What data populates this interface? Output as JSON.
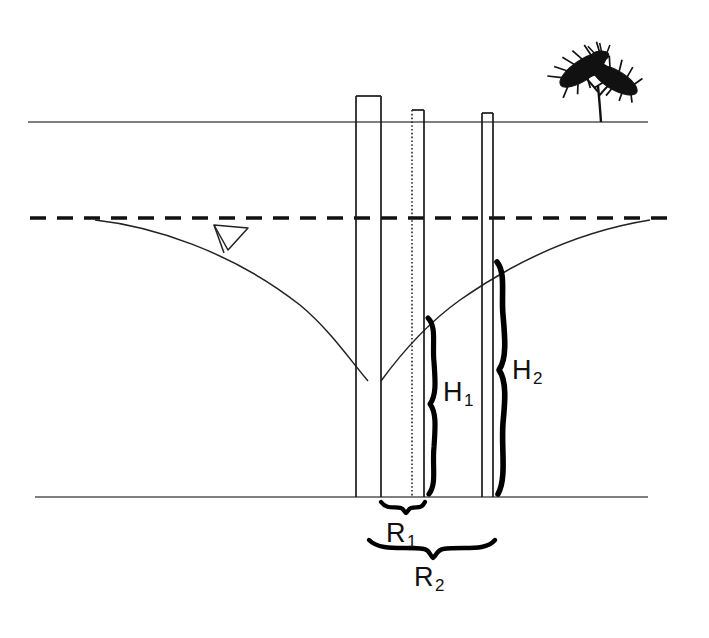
{
  "diagram": {
    "colors": {
      "line": "#1a1a1a",
      "ground_line": "#555555",
      "curve": "#222222",
      "brace": "#000000",
      "background": "#ffffff"
    },
    "labels": [
      {
        "name": "h1-label",
        "base": "H",
        "sub": "1",
        "x": 443,
        "y": 377
      },
      {
        "name": "h2-label",
        "base": "H",
        "sub": "2",
        "x": 512,
        "y": 355
      },
      {
        "name": "r1-label",
        "base": "R",
        "sub": "1",
        "x": 386,
        "y": 518
      },
      {
        "name": "r2-label",
        "base": "R",
        "sub": "2",
        "x": 414,
        "y": 562
      }
    ],
    "elements": {
      "ground_surface_label": "ground surface line",
      "water_table_label": "static water table (dashed)",
      "drawdown_curve_label": "cone of depression curve",
      "impermeable_base_label": "impermeable base line",
      "pumping_well_label": "pumping well casing",
      "observation_well_1_label": "observation well 1",
      "observation_well_2_label": "observation well 2",
      "shrub_label": "shrub",
      "water_level_marker_label": "water table triangle marker"
    },
    "geometry": {
      "ground_y": 122,
      "water_table_y": 218,
      "base_y": 497,
      "ground_x_start": 28,
      "ground_x_end": 648,
      "water_x_start": 30,
      "water_x_end": 678,
      "base_x_start": 35,
      "base_x_end": 648,
      "pumping_well_left": 356,
      "pumping_well_right": 381,
      "pumping_well_top": 96,
      "obs_well_1_left": 412,
      "obs_well_1_right": 424,
      "obs_well_1_top": 110,
      "obs_well_2_left": 482,
      "obs_well_2_right": 493,
      "obs_well_2_top": 113,
      "curve_left_start_x": 95,
      "curve_bottom_y": 380,
      "curve_right_end_x": 650,
      "h1_brace_top": 318,
      "h1_brace_bottom": 497,
      "h2_brace_top": 262,
      "h2_brace_bottom": 497,
      "r1_brace_left": 381,
      "r1_brace_right": 424,
      "r1_brace_y": 505,
      "r2_brace_left": 369,
      "r2_brace_right": 493,
      "r2_brace_y": 544,
      "marker_x": 222,
      "marker_y": 232
    }
  }
}
